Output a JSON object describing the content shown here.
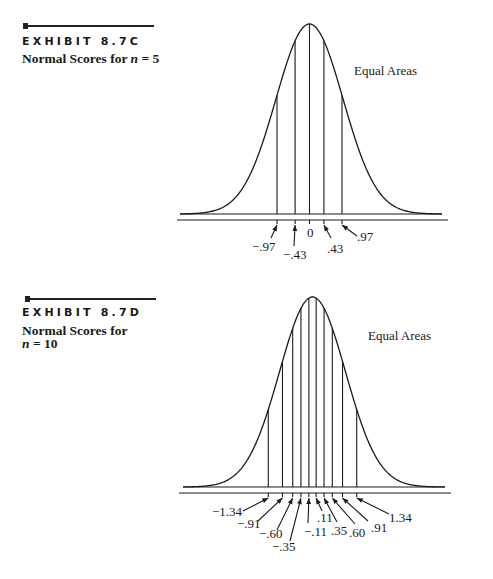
{
  "exhibits": [
    {
      "id_label": "EXHIBIT 8.7C",
      "subtitle_prefix": "Normal Scores for ",
      "subtitle_var": "n",
      "subtitle_suffix": " = 5",
      "annotation": "Equal Areas"
    },
    {
      "id_label": "EXHIBIT 8.7D",
      "subtitle_line1": "Normal Scores for",
      "subtitle_var": "n",
      "subtitle_suffix": " = 10",
      "annotation": "Equal Areas"
    }
  ],
  "chart_data": [
    {
      "type": "line",
      "title": "Normal Scores for n = 5",
      "description": "Standard normal density curve divided into 6 equal-area regions by vertical lines at the normal scores",
      "annotation": "Equal Areas",
      "n": 5,
      "normal_scores": [
        -0.97,
        -0.43,
        0,
        0.43,
        0.97
      ],
      "tick_labels": [
        "−.97",
        "−.43",
        "0",
        ".43",
        ".97"
      ],
      "xlabel": "",
      "ylabel": "",
      "grid": false
    },
    {
      "type": "line",
      "title": "Normal Scores for n = 10",
      "description": "Standard normal density curve divided into 11 equal-area regions by vertical lines at the normal scores",
      "annotation": "Equal Areas",
      "n": 10,
      "normal_scores": [
        -1.34,
        -0.91,
        -0.6,
        -0.35,
        -0.11,
        0.11,
        0.35,
        0.6,
        0.91,
        1.34
      ],
      "tick_labels": [
        "−1.34",
        "−.91",
        "−.60",
        "−.35",
        "−.11",
        ".11",
        ".35",
        ".60",
        ".91",
        "1.34"
      ],
      "xlabel": "",
      "ylabel": "",
      "grid": false
    }
  ]
}
